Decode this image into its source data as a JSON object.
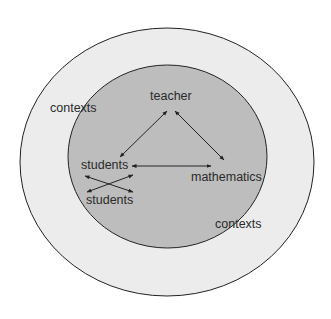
{
  "diagram": {
    "outer_circle": {
      "label": "contexts",
      "fill": "#ececec",
      "stroke": "#222222"
    },
    "inner_circle": {
      "label": "contexts",
      "fill": "#bdbdbd",
      "stroke": "#222222"
    },
    "nodes": {
      "teacher": "teacher",
      "students_top": "students",
      "students_bottom": "students",
      "mathematics": "mathematics"
    },
    "edges": [
      {
        "from": "teacher",
        "to": "students_top",
        "type": "bidirectional"
      },
      {
        "from": "teacher",
        "to": "mathematics",
        "type": "bidirectional"
      },
      {
        "from": "students_top",
        "to": "mathematics",
        "type": "bidirectional"
      },
      {
        "from": "students_top",
        "to": "students_bottom",
        "type": "bidirectional-crossed"
      },
      {
        "from": "students_top",
        "to": "students_bottom",
        "type": "bidirectional-crossed"
      }
    ],
    "labels": {
      "outer_contexts": "contexts",
      "inner_contexts": "contexts"
    }
  }
}
